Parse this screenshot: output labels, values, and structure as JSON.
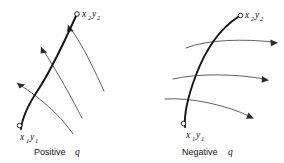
{
  "figure": {
    "background_color": "#fefefe",
    "trajectory_color": "#141414",
    "fieldline_color": "#44464a",
    "panels": [
      {
        "id": "positive",
        "caption_word": "Positive",
        "caption_symbol": "q",
        "start_label": {
          "var1": "x",
          "sub1": "1",
          "var2": "y",
          "sub2": "1"
        },
        "end_label": {
          "var1": "x",
          "sub1": "2",
          "var2": "y",
          "sub2": "2"
        },
        "field_direction": "up-left",
        "field_line_count": 3,
        "trajectory_description": "curve from x1y1 bending up and right to x2y2"
      },
      {
        "id": "negative",
        "caption_word": "Negative",
        "caption_symbol": "q",
        "start_label": {
          "var1": "x",
          "sub1": "1",
          "var2": "y",
          "sub2": "1"
        },
        "end_label": {
          "var1": "x",
          "sub1": "2",
          "var2": "y",
          "sub2": "2"
        },
        "field_direction": "right",
        "field_line_count": 3,
        "trajectory_description": "S-curve from x1y1 rising steeply then flattening to x2y2"
      }
    ]
  }
}
